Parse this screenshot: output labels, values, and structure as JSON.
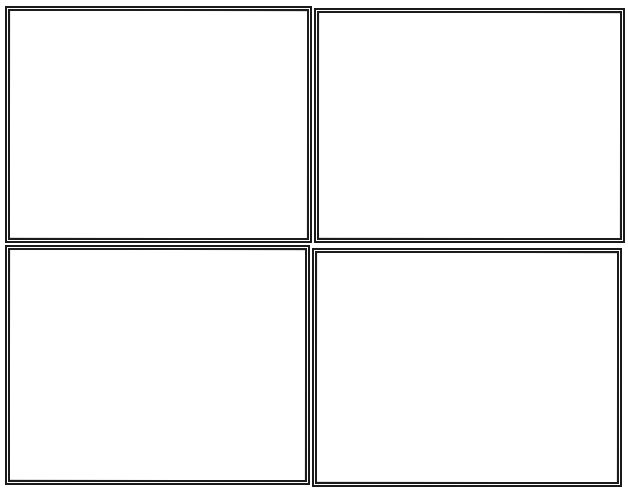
{
  "comic_template": {
    "layout": "2x2 grid",
    "panel_count": 4,
    "border_style": "hand-drawn double line",
    "border_color": "#1a1a1a",
    "background_color": "#ffffff",
    "panels": [
      {
        "id": 1,
        "position": "top-left",
        "content": ""
      },
      {
        "id": 2,
        "position": "top-right",
        "content": ""
      },
      {
        "id": 3,
        "position": "bottom-left",
        "content": ""
      },
      {
        "id": 4,
        "position": "bottom-right",
        "content": ""
      }
    ]
  }
}
